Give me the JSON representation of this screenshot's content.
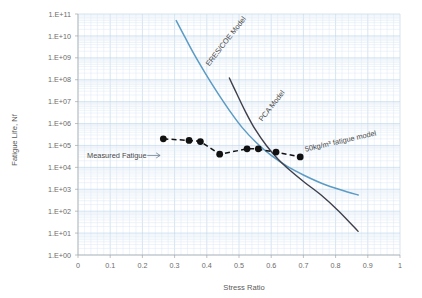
{
  "chart_data": {
    "type": "line",
    "title": "",
    "xlabel": "Stress Ratio",
    "ylabel": "Fatigue Life, Nf",
    "xlim": [
      0,
      1
    ],
    "ylim": [
      1,
      100000000000
    ],
    "yscale": "log",
    "grid": true,
    "legend_position": "inline-annotations",
    "x_ticks": [
      "0",
      "0.1",
      "0.2",
      "0.3",
      "0.4",
      "0.5",
      "0.6",
      "0.7",
      "0.8",
      "0.9",
      "1"
    ],
    "x_tick_values": [
      0,
      0.1,
      0.2,
      0.3,
      0.4,
      0.5,
      0.6,
      0.7,
      0.8,
      0.9,
      1
    ],
    "y_ticks": [
      "1.E+00",
      "1.E+01",
      "1.E+02",
      "1.E+03",
      "1.E+04",
      "1.E+05",
      "1.E+06",
      "1.E+07",
      "1.E+08",
      "1.E+09",
      "1.E+10",
      "1.E+11"
    ],
    "y_tick_exponents": [
      0,
      1,
      2,
      3,
      4,
      5,
      6,
      7,
      8,
      9,
      10,
      11
    ],
    "series": [
      {
        "name": "ERES/COE Model",
        "color": "#5b9bc4",
        "style": "solid",
        "label_angle": -52,
        "x": [
          0.305,
          0.33,
          0.36,
          0.395,
          0.43,
          0.47,
          0.51,
          0.555,
          0.6,
          0.65,
          0.7,
          0.76,
          0.82,
          0.87
        ],
        "y": [
          50000000000.0,
          10000000000.0,
          1500000000.0,
          200000000.0,
          30000000.0,
          4000000.0,
          650000.0,
          130000.0,
          35000.0,
          11000.0,
          4500.0,
          1800.0,
          900.0,
          550.0
        ]
      },
      {
        "name": "PCA Model",
        "color": "#3f3f4c",
        "style": "solid",
        "label_angle": -52,
        "x": [
          0.47,
          0.495,
          0.52,
          0.55,
          0.585,
          0.62,
          0.66,
          0.705,
          0.755,
          0.81,
          0.87
        ],
        "y": [
          120000000.0,
          20000000.0,
          3500000.0,
          550000.0,
          100000.0,
          25000.0,
          7000.0,
          2000.0,
          550.0,
          100.0,
          12.0
        ]
      },
      {
        "name": "50kg/m³ fatigue model",
        "color": "#121212",
        "style": "dashed-with-markers",
        "label_angle": -13,
        "x": [
          0.265,
          0.345,
          0.37,
          0.38,
          0.44,
          0.525,
          0.555,
          0.565,
          0.615,
          0.69
        ],
        "y": [
          200000.0,
          170000.0,
          160000.0,
          150000.0,
          40000.0,
          70000.0,
          70000.0,
          65000.0,
          50000.0,
          30000.0
        ]
      }
    ],
    "markers": [
      {
        "x": 0.265,
        "y": 200000.0
      },
      {
        "x": 0.345,
        "y": 170000.0
      },
      {
        "x": 0.38,
        "y": 150000.0
      },
      {
        "x": 0.44,
        "y": 40000.0
      },
      {
        "x": 0.525,
        "y": 70000.0
      },
      {
        "x": 0.56,
        "y": 70000.0
      },
      {
        "x": 0.615,
        "y": 50000.0
      },
      {
        "x": 0.69,
        "y": 30000.0
      }
    ],
    "annotations": [
      {
        "text": "Measured Fatigue",
        "x": 0.1,
        "y": 35000.0,
        "arrow_to_x": 0.255
      }
    ]
  },
  "labels": {
    "eres_model": "ERES/COE Model",
    "pca_model": "PCA Model",
    "fatigue_model": "50kg/m³ fatigue model",
    "measured_fatigue": "Measured Fatigue",
    "x_axis_title": "Stress Ratio",
    "y_axis_title": "Fatigue Life, Nf"
  },
  "colors": {
    "eres": "#5b9bc4",
    "pca": "#3f3f4c",
    "measured": "#121212",
    "grid_minor": "#dce9f5",
    "grid_major": "#b9d3e8",
    "axis": "#a6a6a6",
    "text": "#595959",
    "background": "#ffffff"
  }
}
